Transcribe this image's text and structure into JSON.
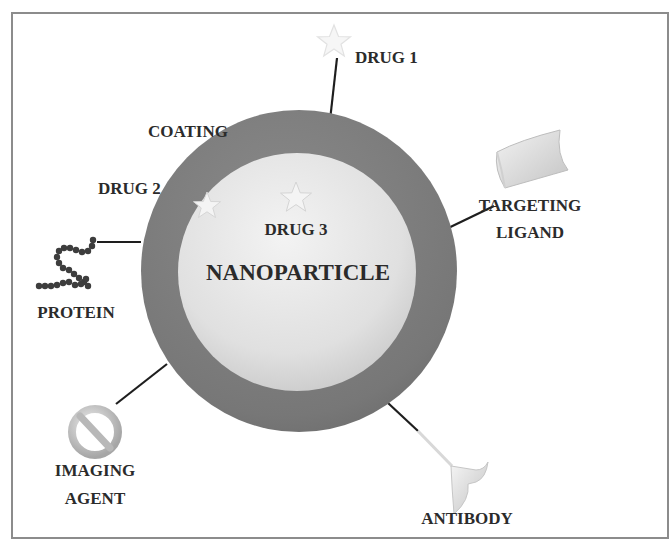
{
  "diagram": {
    "center_label": "NANOPARTICLE",
    "colors": {
      "frame": "#8c8c8c",
      "coating": "#7b7b7b",
      "core": "#e2e2e2",
      "line": "#1e1e1e",
      "text": "#2b2b2b",
      "star": "#f4f4f4"
    },
    "components": [
      {
        "id": "drug1",
        "label": "DRUG 1",
        "icon": "star-icon",
        "position": "top, tethered outside coating"
      },
      {
        "id": "coating",
        "label": "COATING",
        "icon": "outer-ring",
        "position": "outer shell"
      },
      {
        "id": "drug2",
        "label": "DRUG 2",
        "icon": "star-icon",
        "position": "embedded in coating"
      },
      {
        "id": "drug3",
        "label": "DRUG 3",
        "icon": "star-icon",
        "position": "inside core"
      },
      {
        "id": "targeting_ligand",
        "label_line1": "TARGETING",
        "label_line2": "LIGAND",
        "icon": "ligand-icon",
        "position": "upper right, tethered"
      },
      {
        "id": "protein",
        "label": "PROTEIN",
        "icon": "protein-chain-icon",
        "position": "left, tethered"
      },
      {
        "id": "imaging_agent",
        "label_line1": "IMAGING",
        "label_line2": "AGENT",
        "icon": "imaging-agent-icon",
        "position": "lower left, tethered"
      },
      {
        "id": "antibody",
        "label": "ANTIBODY",
        "icon": "antibody-icon",
        "position": "lower right, tethered"
      }
    ]
  },
  "labels": {
    "drug1": "DRUG 1",
    "coating": "COATING",
    "drug2": "DRUG 2",
    "drug3": "DRUG 3",
    "nanoparticle": "NANOPARTICLE",
    "targeting_line1": "TARGETING",
    "targeting_line2": "LIGAND",
    "protein": "PROTEIN",
    "imaging_line1": "IMAGING",
    "imaging_line2": "AGENT",
    "antibody": "ANTIBODY"
  }
}
